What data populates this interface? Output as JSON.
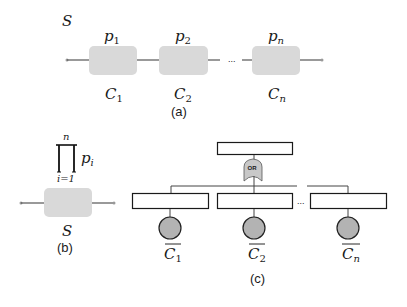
{
  "colors": {
    "component_fill": "#d9d9d9",
    "basic_event_fill": "#b3b3b3",
    "line": "#444444",
    "box_stroke": "#1a1a1a",
    "or_gate_fill": "#c8c8c8"
  },
  "panel_a": {
    "system_label": "S",
    "components": [
      {
        "prob": "p",
        "prob_sub": "1",
        "name": "C",
        "name_sub": "1"
      },
      {
        "prob": "p",
        "prob_sub": "2",
        "name": "C",
        "name_sub": "2"
      },
      {
        "prob": "p",
        "prob_sub": "n",
        "name": "C",
        "name_sub": "n"
      }
    ],
    "ellipsis": "...",
    "caption": "(a)"
  },
  "panel_b": {
    "product_upper": "n",
    "product_lower": "i=1",
    "product_symbol": "∏",
    "product_term": "p",
    "product_term_sub": "i",
    "system_label": "S",
    "caption": "(b)"
  },
  "panel_c": {
    "gate_label": "OR",
    "ellipsis": "...",
    "basic_events": [
      {
        "name": "C",
        "sub": "1",
        "negated": true
      },
      {
        "name": "C",
        "sub": "2",
        "negated": true
      },
      {
        "name": "C",
        "sub": "n",
        "negated": true
      }
    ],
    "caption": "(c)"
  }
}
